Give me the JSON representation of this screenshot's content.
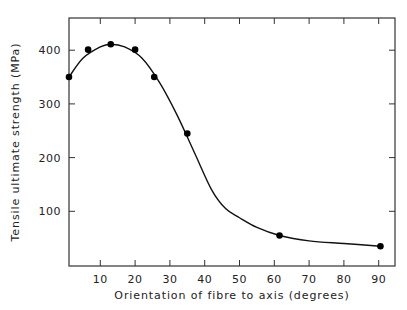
{
  "chart_data": {
    "type": "scatter",
    "title": "",
    "xlabel": "Orientation of fibre to axis (degrees)",
    "ylabel": "Tensile ultimate strength (MPa)",
    "xlim": [
      1,
      94
    ],
    "ylim": [
      0,
      470
    ],
    "xticks": [
      10,
      20,
      30,
      40,
      50,
      60,
      70,
      80,
      90
    ],
    "yticks": [
      100,
      200,
      300,
      400
    ],
    "grid": false,
    "legend": null,
    "series": [
      {
        "name": "measured",
        "style": "points",
        "x": [
          1,
          6.5,
          13,
          20,
          25.5,
          35,
          61.5,
          90.5
        ],
        "y": [
          350,
          401,
          411,
          401,
          350,
          245,
          55,
          35
        ]
      },
      {
        "name": "fitted curve",
        "style": "line",
        "x": [
          1,
          5,
          10,
          13,
          17,
          22,
          27,
          32,
          37,
          42,
          46,
          50,
          55,
          61.5,
          70,
          80,
          90.5
        ],
        "y": [
          350,
          385,
          406,
          411,
          406,
          385,
          340,
          280,
          210,
          140,
          105,
          88,
          70,
          55,
          45,
          40,
          35
        ]
      }
    ]
  }
}
